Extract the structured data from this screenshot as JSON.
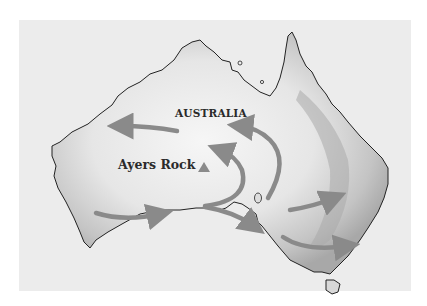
{
  "map": {
    "title": "Australia",
    "labels": {
      "country": "AUSTRALIA",
      "landmark": "Ayers Rock"
    },
    "icons": {
      "landmark_marker": "triangle-marker"
    },
    "colors": {
      "background": "#ffffff",
      "panel": "#ececec",
      "land_light": "#f4f4f4",
      "land_shade": "#b8b8b8",
      "coastline": "#222222",
      "arrows": "#8a8a8a",
      "marker": "#8a8a8a"
    },
    "arrows": [
      {
        "name": "west-arrow",
        "direction": "west"
      },
      {
        "name": "north-curve-arrow",
        "direction": "north-west"
      },
      {
        "name": "inner-curve-arrow",
        "direction": "north"
      },
      {
        "name": "southwest-arrow",
        "direction": "east"
      },
      {
        "name": "south-arrow",
        "direction": "south-east"
      },
      {
        "name": "east-arrow",
        "direction": "east-north-east"
      },
      {
        "name": "southeast-arrow",
        "direction": "east"
      }
    ]
  }
}
